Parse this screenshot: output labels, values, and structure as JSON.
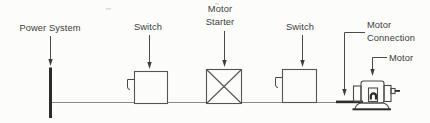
{
  "diagram": {
    "colors": {
      "background": "#fcfcfa",
      "ink": "#2b2b2b",
      "line": "#555555",
      "wire": "#8a8a8a",
      "text": "#3d3d3d"
    },
    "components": {
      "power_system": {
        "label": "Power System",
        "symbol": "bus-bar"
      },
      "switch_1": {
        "label": "Switch",
        "symbol": "box-with-handle"
      },
      "motor_starter": {
        "label_line1": "Motor",
        "label_line2": "Starter",
        "symbol": "box-with-x"
      },
      "switch_2": {
        "label": "Switch",
        "symbol": "box-with-handle"
      },
      "motor_connection": {
        "label_line1": "Motor",
        "label_line2": "Connection",
        "symbol": "thick-wire"
      },
      "motor": {
        "label": "Motor",
        "symbol": "motor-drawing"
      }
    }
  }
}
